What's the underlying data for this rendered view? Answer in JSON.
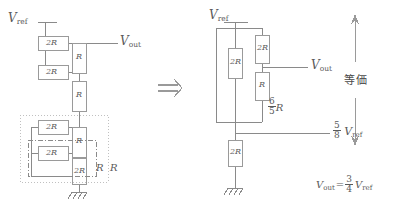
{
  "figure": {
    "title_hidden": "",
    "transform_arrow": "⇒",
    "equivalence_label": "等価"
  },
  "left_circuit": {
    "name": "R-2R ladder expanded",
    "vref_label": "V",
    "vref_sub": "ref",
    "vout_label": "V",
    "vout_sub": "out",
    "resistors": [
      {
        "id": "L-2R-top",
        "label": "2R",
        "x": 38,
        "y": 36,
        "w": 30,
        "h": 14,
        "orient": "h"
      },
      {
        "id": "L-2R-second",
        "label": "2R",
        "x": 38,
        "y": 65,
        "w": 30,
        "h": 14,
        "orient": "h"
      },
      {
        "id": "L-R-top",
        "label": "R",
        "x": 72,
        "y": 43,
        "w": 14,
        "h": 30,
        "orient": "v"
      },
      {
        "id": "L-R-mid",
        "label": "R",
        "x": 72,
        "y": 81,
        "w": 14,
        "h": 30,
        "orient": "v"
      },
      {
        "id": "L-2R-third",
        "label": "2R",
        "x": 38,
        "y": 120,
        "w": 30,
        "h": 14,
        "orient": "h"
      },
      {
        "id": "L-R-lower",
        "label": "R",
        "x": 72,
        "y": 127,
        "w": 14,
        "h": 30,
        "orient": "v"
      },
      {
        "id": "L-2R-fourth",
        "label": "2R",
        "x": 38,
        "y": 146,
        "w": 30,
        "h": 14,
        "orient": "h"
      },
      {
        "id": "L-2R-bottom",
        "label": "2R",
        "x": 72,
        "y": 158,
        "w": 14,
        "h": 26,
        "orient": "v"
      }
    ],
    "group_labels": [
      {
        "id": "dashed-group-R",
        "label": "R",
        "x": 96,
        "y": 167
      },
      {
        "id": "dotted-group-R",
        "label": "R",
        "x": 110,
        "y": 167
      }
    ],
    "ground": {
      "x": 79,
      "y": 192
    }
  },
  "right_circuit": {
    "name": "R-2R ladder simplified",
    "vref_label": "V",
    "vref_sub": "ref",
    "vout_label": "V",
    "vout_sub": "out",
    "resistors": [
      {
        "id": "R-2R-left",
        "label": "2R",
        "x": 228,
        "y": 48,
        "w": 14,
        "h": 30,
        "orient": "v"
      },
      {
        "id": "R-2R-upper",
        "label": "2R",
        "x": 255,
        "y": 35,
        "w": 14,
        "h": 28,
        "orient": "v"
      },
      {
        "id": "R-R-lower",
        "label": "R",
        "x": 255,
        "y": 72,
        "w": 14,
        "h": 28,
        "orient": "v"
      },
      {
        "id": "R-2R-bottom",
        "label": "2R",
        "x": 228,
        "y": 140,
        "w": 14,
        "h": 26,
        "orient": "v"
      }
    ],
    "equivalent_resistance": {
      "num": "6",
      "den": "5",
      "unit": "R"
    },
    "node_voltage": {
      "num": "5",
      "den": "8",
      "symbol": "V",
      "sub": "ref"
    },
    "ground": {
      "x": 235,
      "y": 188
    }
  },
  "result_equation": {
    "lhs": "V",
    "lhs_sub": "out",
    "equals": "=",
    "num": "3",
    "den": "4",
    "rhs": "V",
    "rhs_sub": "ref"
  },
  "colors": {
    "wire": "#8a8a8a",
    "box_stroke": "#9a9a9a",
    "dashed": "#7a7a7a",
    "dotted": "#b5b5b5",
    "text": "#5a5a5a",
    "background": "#ffffff"
  }
}
